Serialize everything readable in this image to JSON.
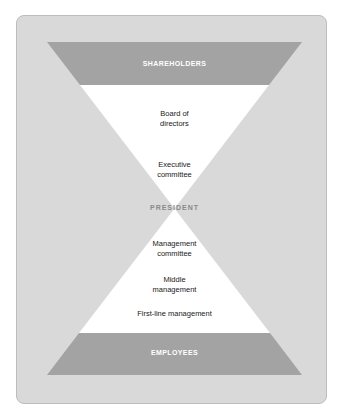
{
  "diagram": {
    "type": "hourglass-organization-chart",
    "colors": {
      "panel": "#d9d9d9",
      "band": "#a3a3a3",
      "level_area": "#ffffff",
      "band_text": "#ffffff",
      "level_text": "#1a1a1a",
      "center_text": "#8a8a8a"
    },
    "top_band": {
      "label": "SHAREHOLDERS"
    },
    "upper_levels": [
      {
        "lines": [
          "Board of",
          "directors"
        ]
      },
      {
        "lines": [
          "Executive",
          "committee"
        ]
      }
    ],
    "center": {
      "label": "PRESIDENT"
    },
    "lower_levels": [
      {
        "lines": [
          "Management",
          "committee"
        ]
      },
      {
        "lines": [
          "Middle",
          "management"
        ]
      },
      {
        "lines": [
          "First-line management"
        ]
      }
    ],
    "bottom_band": {
      "label": "EMPLOYEES"
    }
  }
}
